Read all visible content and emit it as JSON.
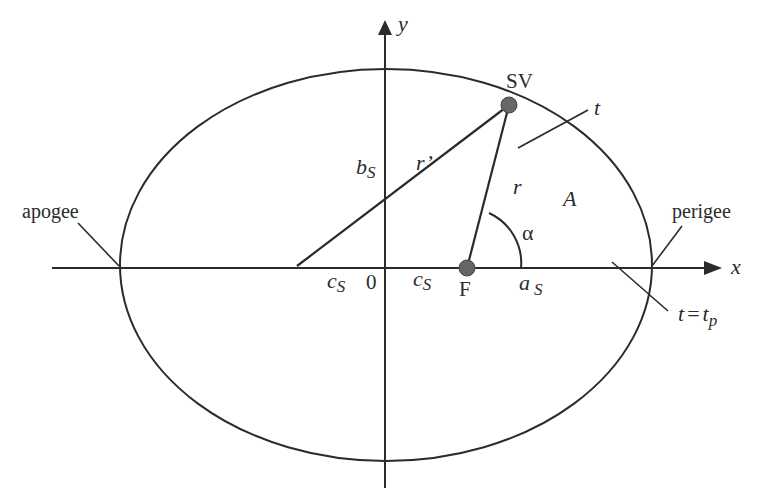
{
  "figure": {
    "type": "orbital-ellipse-diagram",
    "colors": {
      "line": "#2b2b2b",
      "dot": "#666666",
      "background": "#ffffff"
    },
    "axes": {
      "x_label": "x",
      "y_label": "y",
      "origin_label": "0"
    },
    "labels": {
      "apogee": "apogee",
      "perigee": "perigee",
      "satellite": "SV",
      "focus": "F",
      "time": "t",
      "time_perigee_t": "t",
      "time_perigee_eq": "=",
      "time_perigee_tp": "t",
      "time_perigee_sub": "p",
      "semi_minor": "b",
      "semi_minor_sub": "S",
      "r_prime": "r’",
      "r": "r",
      "area": "A",
      "angle": "α",
      "c_left": "c",
      "c_left_sub": "S",
      "c_right": "c",
      "c_right_sub": "S",
      "semi_major": "a",
      "semi_major_sub": "S"
    }
  }
}
